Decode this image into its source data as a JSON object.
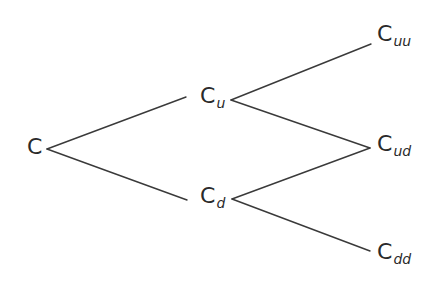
{
  "diagram": {
    "type": "binomial-tree",
    "line_color": "#3a3a3a",
    "text_color": "#2a2a2a",
    "nodes": [
      {
        "id": "C",
        "base": "C",
        "sub": "",
        "x": 27,
        "y": 139
      },
      {
        "id": "Cu",
        "base": "C",
        "sub": "u",
        "x": 200,
        "y": 88
      },
      {
        "id": "Cd",
        "base": "C",
        "sub": "d",
        "x": 200,
        "y": 188
      },
      {
        "id": "Cuu",
        "base": "C",
        "sub": "uu",
        "x": 377,
        "y": 26
      },
      {
        "id": "Cud",
        "base": "C",
        "sub": "ud",
        "x": 377,
        "y": 136
      },
      {
        "id": "Cdd",
        "base": "C",
        "sub": "dd",
        "x": 377,
        "y": 244
      }
    ],
    "edges": [
      {
        "from": "C",
        "to": "Cu",
        "x1": 47,
        "y1": 149,
        "x2": 186,
        "y2": 97
      },
      {
        "from": "C",
        "to": "Cd",
        "x1": 47,
        "y1": 149,
        "x2": 187,
        "y2": 200
      },
      {
        "from": "Cu",
        "to": "Cuu",
        "x1": 231,
        "y1": 100,
        "x2": 371,
        "y2": 44
      },
      {
        "from": "Cu",
        "to": "Cud",
        "x1": 231,
        "y1": 100,
        "x2": 370,
        "y2": 148
      },
      {
        "from": "Cd",
        "to": "Cud",
        "x1": 232,
        "y1": 199,
        "x2": 370,
        "y2": 148
      },
      {
        "from": "Cd",
        "to": "Cdd",
        "x1": 232,
        "y1": 199,
        "x2": 370,
        "y2": 251
      }
    ]
  }
}
